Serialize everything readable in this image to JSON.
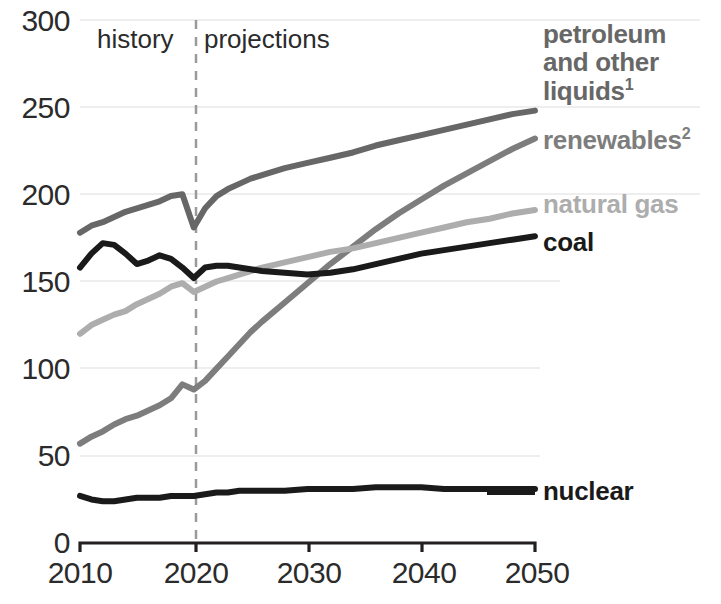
{
  "chart_data": {
    "type": "line",
    "title": "",
    "xlabel": "",
    "ylabel": "",
    "xlim": [
      2010,
      2050
    ],
    "ylim": [
      0,
      300
    ],
    "ytick_values": [
      0,
      50,
      100,
      150,
      200,
      250,
      300
    ],
    "xtick_values": [
      2010,
      2020,
      2030,
      2040,
      2050
    ],
    "grid": true,
    "legend_position": "right-inline",
    "annotations": [
      {
        "text": "history",
        "x": 2014,
        "y": 290
      },
      {
        "text": "projections",
        "x": 2026,
        "y": 290
      }
    ],
    "divider_year": 2020,
    "x": [
      2010,
      2011,
      2012,
      2013,
      2014,
      2015,
      2016,
      2017,
      2018,
      2019,
      2020,
      2021,
      2022,
      2023,
      2024,
      2025,
      2026,
      2028,
      2030,
      2032,
      2034,
      2036,
      2038,
      2040,
      2042,
      2044,
      2046,
      2048,
      2050
    ],
    "series": [
      {
        "name": "petroleum and other liquids",
        "color": "#676767",
        "values": [
          178,
          182,
          184,
          187,
          190,
          192,
          194,
          196,
          199,
          200,
          181,
          192,
          199,
          203,
          206,
          209,
          211,
          215,
          218,
          221,
          224,
          228,
          231,
          234,
          237,
          240,
          243,
          246,
          248
        ]
      },
      {
        "name": "renewables",
        "color": "#7d7d7d",
        "values": [
          57,
          61,
          64,
          68,
          71,
          73,
          76,
          79,
          83,
          91,
          88,
          93,
          100,
          107,
          114,
          121,
          127,
          138,
          149,
          160,
          170,
          180,
          189,
          197,
          205,
          212,
          219,
          226,
          232
        ]
      },
      {
        "name": "natural gas",
        "color": "#adadad",
        "values": [
          120,
          125,
          128,
          131,
          133,
          137,
          140,
          143,
          147,
          149,
          144,
          147,
          150,
          152,
          154,
          156,
          158,
          161,
          164,
          167,
          169,
          172,
          175,
          178,
          181,
          184,
          186,
          189,
          191
        ]
      },
      {
        "name": "coal",
        "color": "#1a1a1a",
        "values": [
          158,
          166,
          172,
          171,
          166,
          160,
          162,
          165,
          163,
          158,
          152,
          158,
          159,
          159,
          158,
          157,
          156,
          155,
          154,
          155,
          157,
          160,
          163,
          166,
          168,
          170,
          172,
          174,
          176
        ]
      },
      {
        "name": "nuclear",
        "color": "#1a1a1a",
        "values": [
          27,
          25,
          24,
          24,
          25,
          26,
          26,
          26,
          27,
          27,
          27,
          28,
          29,
          29,
          30,
          30,
          30,
          30,
          31,
          31,
          31,
          32,
          32,
          32,
          31,
          31,
          31,
          31,
          31
        ]
      }
    ]
  },
  "axis": {
    "ytick_labels": [
      "300",
      "250",
      "200",
      "150",
      "100",
      "50",
      "0"
    ],
    "xtick_labels": [
      "2010",
      "2020",
      "2030",
      "2040",
      "2050"
    ]
  },
  "annotations": {
    "history": "history",
    "projections": "projections"
  },
  "legend": {
    "petroleum_line1": "petroleum",
    "petroleum_line2": "and other",
    "petroleum_line3": "liquids",
    "petroleum_sup": "1",
    "renewables": "renewables",
    "renewables_sup": "2",
    "natural_gas": "natural gas",
    "coal": "coal",
    "nuclear": "nuclear"
  },
  "colors": {
    "petroleum": "#676767",
    "renewables": "#7d7d7d",
    "natural_gas": "#adadad",
    "coal": "#1a1a1a",
    "nuclear": "#1a1a1a",
    "grid": "#e8e8e8",
    "axis": "#231f20",
    "divider": "#9a9a9a"
  }
}
